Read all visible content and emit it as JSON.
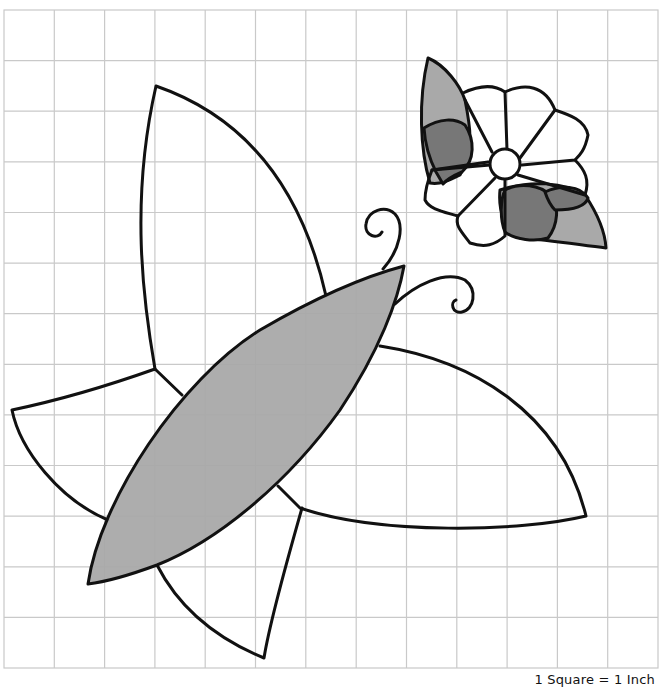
{
  "figure": {
    "scale_label": "1 Square = 1 Inch",
    "grid": {
      "columns": 13,
      "rows": 13,
      "square_size_inches": 1,
      "line_color": "#c9c9c9"
    },
    "colors": {
      "outline": "#111111",
      "light_fill": "#ffffff",
      "medium_gray": "#a9a9a9",
      "dark_gray": "#777777"
    },
    "pieces": [
      {
        "name": "upper-wing",
        "fill": "white"
      },
      {
        "name": "left-lower-wing",
        "fill": "white"
      },
      {
        "name": "right-wing",
        "fill": "white"
      },
      {
        "name": "bottom-wing",
        "fill": "white"
      },
      {
        "name": "body",
        "fill": "medium gray"
      },
      {
        "name": "antenna-left",
        "fill": "none"
      },
      {
        "name": "antenna-right",
        "fill": "none"
      },
      {
        "name": "flower-petals",
        "count": 8,
        "fill": "white"
      },
      {
        "name": "flower-center",
        "fill": "white"
      },
      {
        "name": "flower-leaves",
        "count": 2,
        "fill": "medium gray"
      },
      {
        "name": "flower-leaf-shadows",
        "count": 2,
        "fill": "dark gray"
      }
    ]
  }
}
